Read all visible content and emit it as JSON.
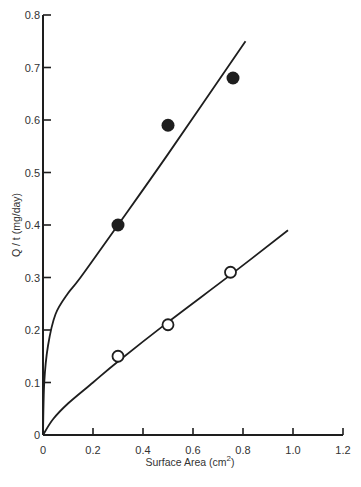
{
  "chart_data": {
    "type": "scatter",
    "title": "",
    "xlabel": "Surface Area (cm²)",
    "xlabel_base": "Surface Area (cm",
    "xlabel_sup": "2",
    "xlabel_close": ")",
    "ylabel": "Q / t (mg/day)",
    "xlim": [
      0,
      1.2
    ],
    "ylim": [
      0,
      0.8
    ],
    "grid": false,
    "legend": null,
    "x_ticks": [
      0,
      0.2,
      0.4,
      0.6,
      0.8,
      1.0,
      1.2
    ],
    "x_tick_labels": [
      "0",
      "0.2",
      "0.4",
      "0.6",
      "0.8",
      "1.0",
      "1.2"
    ],
    "y_ticks": [
      0,
      0.1,
      0.2,
      0.3,
      0.4,
      0.5,
      0.6,
      0.7,
      0.8
    ],
    "y_tick_labels": [
      "0",
      "0.1",
      "0.2",
      "0.3",
      "0.4",
      "0.5",
      "0.6",
      "0.7",
      "0.8"
    ],
    "series": [
      {
        "name": "filled circles",
        "marker": "filled-circle",
        "points": [
          {
            "x": 0.3,
            "y": 0.4
          },
          {
            "x": 0.5,
            "y": 0.59
          },
          {
            "x": 0.76,
            "y": 0.68
          }
        ],
        "fit_curve": [
          {
            "x": 0,
            "y": 0
          },
          {
            "x": 0.005,
            "y": 0.1
          },
          {
            "x": 0.02,
            "y": 0.17
          },
          {
            "x": 0.05,
            "y": 0.23
          },
          {
            "x": 0.1,
            "y": 0.27
          },
          {
            "x": 0.15,
            "y": 0.3
          },
          {
            "x": 0.3,
            "y": 0.4
          },
          {
            "x": 0.5,
            "y": 0.535
          },
          {
            "x": 0.81,
            "y": 0.75
          }
        ]
      },
      {
        "name": "open circles",
        "marker": "open-circle",
        "points": [
          {
            "x": 0.3,
            "y": 0.15
          },
          {
            "x": 0.5,
            "y": 0.21
          },
          {
            "x": 0.75,
            "y": 0.31
          }
        ],
        "fit_curve": [
          {
            "x": 0,
            "y": 0
          },
          {
            "x": 0.04,
            "y": 0.03
          },
          {
            "x": 0.1,
            "y": 0.06
          },
          {
            "x": 0.2,
            "y": 0.1
          },
          {
            "x": 0.3,
            "y": 0.14
          },
          {
            "x": 0.5,
            "y": 0.215
          },
          {
            "x": 0.75,
            "y": 0.305
          },
          {
            "x": 0.98,
            "y": 0.39
          }
        ]
      }
    ]
  },
  "colors": {
    "ink": "#1e1e1e",
    "background": "#ffffff"
  }
}
